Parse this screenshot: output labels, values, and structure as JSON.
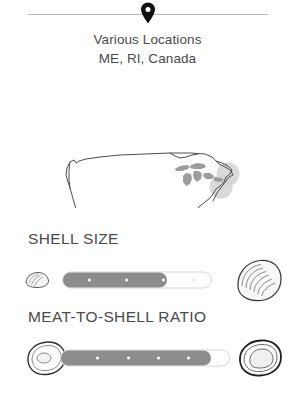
{
  "header": {
    "pin_icon": "map-pin-icon",
    "location_lines": [
      "Various Locations",
      "ME, RI, Canada"
    ]
  },
  "map": {
    "icon": "us-map-outline",
    "highlight_circles": 2,
    "great_lakes_shaded": true,
    "outline_color": "#4d4d4d",
    "lakes_color": "#9a9a9a",
    "highlight_color": "#cfcfcf"
  },
  "metrics": [
    {
      "key": "shell_size",
      "title": "SHELL SIZE",
      "left_icon": "small-clam-shell-icon",
      "right_icon": "large-clam-shell-icon",
      "fill_percent": 70,
      "ticks": [
        18,
        43,
        68,
        88
      ],
      "filled_ticks": 3,
      "track_color": "#ffffff",
      "fill_color": "#8c8c8c"
    },
    {
      "key": "meat_to_shell_ratio",
      "title": "MEAT-TO-SHELL RATIO",
      "left_icon": "oyster-small-meat-icon",
      "right_icon": "oyster-large-meat-icon",
      "fill_percent": 89,
      "ticks": [
        22,
        40,
        58,
        76
      ],
      "filled_ticks": 4,
      "track_color": "#ffffff",
      "fill_color": "#8c8c8c"
    }
  ],
  "colors": {
    "text": "#4a4a4a",
    "divider": "#b9b9b9",
    "slider_fill": "#8c8c8c",
    "slider_track_border": "#d8d8d8"
  }
}
